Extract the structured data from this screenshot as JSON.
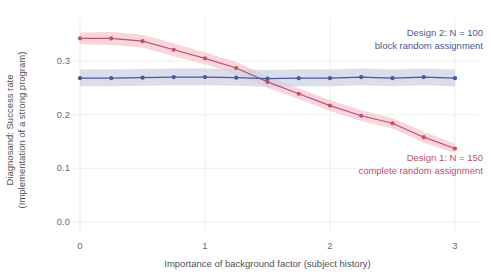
{
  "chart_data": {
    "type": "line",
    "title": "",
    "xlabel": "Importance of background factor (subject history)",
    "ylabel": "Diagnosand: Success rate\n(Implementation of a strong program)",
    "ylabel_line1": "Diagnosand: Success rate",
    "ylabel_line2": "(Implementation of a strong program)",
    "xlim": [
      0,
      3
    ],
    "ylim": [
      0.0,
      0.355
    ],
    "xticks": [
      0,
      1,
      2,
      3
    ],
    "xtick_labels": [
      "0",
      "1",
      "2",
      "3"
    ],
    "yticks": [
      0.0,
      0.1,
      0.2,
      0.3
    ],
    "ytick_labels": [
      "0.0",
      "0.1",
      "0.2",
      "0.3"
    ],
    "grid": true,
    "legend_position": "inline-annotation",
    "x": [
      0,
      0.25,
      0.5,
      0.75,
      1.0,
      1.25,
      1.5,
      1.75,
      2.0,
      2.25,
      2.5,
      2.75,
      3.0
    ],
    "series": [
      {
        "name": "Design 1: N = 150 complete random assignment",
        "color": "#c0506e",
        "ribbon_color": "#f4c8d3",
        "values": [
          0.342,
          0.342,
          0.337,
          0.321,
          0.305,
          0.287,
          0.261,
          0.239,
          0.217,
          0.198,
          0.184,
          0.158,
          0.137
        ],
        "ci_lower": [
          0.331,
          0.33,
          0.325,
          0.309,
          0.294,
          0.276,
          0.25,
          0.229,
          0.207,
          0.188,
          0.174,
          0.148,
          0.128
        ],
        "ci_upper": [
          0.353,
          0.354,
          0.349,
          0.333,
          0.316,
          0.298,
          0.272,
          0.249,
          0.227,
          0.208,
          0.194,
          0.168,
          0.146
        ]
      },
      {
        "name": "Design 2: N = 100 block random assignment",
        "color": "#4a5899",
        "ribbon_color": "#ccd2e6",
        "values": [
          0.268,
          0.268,
          0.269,
          0.27,
          0.27,
          0.269,
          0.267,
          0.268,
          0.268,
          0.27,
          0.268,
          0.27,
          0.268
        ],
        "ci_lower": [
          0.253,
          0.253,
          0.254,
          0.255,
          0.255,
          0.254,
          0.252,
          0.253,
          0.253,
          0.255,
          0.253,
          0.255,
          0.253
        ],
        "ci_upper": [
          0.284,
          0.284,
          0.285,
          0.286,
          0.286,
          0.285,
          0.283,
          0.284,
          0.284,
          0.286,
          0.284,
          0.286,
          0.284
        ]
      }
    ],
    "annotations": [
      {
        "id": "design2",
        "line1": "Design 2: N = 100",
        "line2": "block random assignment",
        "color": "#4a5899"
      },
      {
        "id": "design1",
        "line1": "Design 1: N = 150",
        "line2": "complete random assignment",
        "color": "#c0506e"
      }
    ]
  },
  "colors": {
    "design1_line": "#c0506e",
    "design1_band": "#f4c8d3",
    "design2_line": "#4a5899",
    "design2_band": "#ccd2e6",
    "grid": "#e8e8e8",
    "text": "#4f4f4f",
    "background": "#ffffff"
  }
}
